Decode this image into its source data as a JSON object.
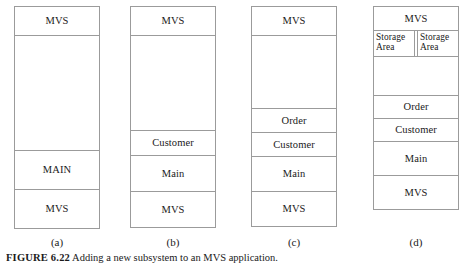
{
  "figure": {
    "caption_label": "FIGURE 6.22",
    "caption_text": "Adding a new subsystem to an MVS application.",
    "panels": [
      {
        "key": "a",
        "subcaption": "(a)",
        "rows": [
          {
            "label": "MVS",
            "height": 30,
            "type": "labeled"
          },
          {
            "label": "",
            "height": 116,
            "type": "empty"
          },
          {
            "label": "MAIN",
            "height": 40,
            "type": "labeled"
          },
          {
            "label": "MVS",
            "height": 40,
            "type": "labeled"
          }
        ]
      },
      {
        "key": "b",
        "subcaption": "(b)",
        "rows": [
          {
            "label": "MVS",
            "height": 30,
            "type": "labeled"
          },
          {
            "label": "",
            "height": 96,
            "type": "empty"
          },
          {
            "label": "Customer",
            "height": 26,
            "type": "labeled"
          },
          {
            "label": "Main",
            "height": 37,
            "type": "labeled"
          },
          {
            "label": "MVS",
            "height": 37,
            "type": "labeled"
          }
        ]
      },
      {
        "key": "c",
        "subcaption": "(c)",
        "rows": [
          {
            "label": "MVS",
            "height": 30,
            "type": "labeled"
          },
          {
            "label": "",
            "height": 74,
            "type": "empty"
          },
          {
            "label": "Order",
            "height": 25,
            "type": "labeled"
          },
          {
            "label": "Customer",
            "height": 25,
            "type": "labeled"
          },
          {
            "label": "Main",
            "height": 36,
            "type": "labeled"
          },
          {
            "label": "MVS",
            "height": 36,
            "type": "labeled"
          }
        ]
      },
      {
        "key": "d",
        "subcaption": "(d)",
        "rows": [
          {
            "label": "MVS",
            "height": 25,
            "type": "labeled"
          },
          {
            "type": "split",
            "height": 27,
            "cells": [
              {
                "line1": "Storage",
                "line2": "Area"
              },
              {
                "line1": "Storage",
                "line2": "Area"
              }
            ]
          },
          {
            "label": "",
            "height": 40,
            "type": "empty"
          },
          {
            "label": "Order",
            "height": 24,
            "type": "labeled"
          },
          {
            "label": "Customer",
            "height": 24,
            "type": "labeled"
          },
          {
            "label": "Main",
            "height": 35,
            "type": "labeled"
          },
          {
            "label": "MVS",
            "height": 35,
            "type": "labeled"
          }
        ]
      }
    ]
  },
  "colors": {
    "border": "#9b9b9b",
    "background": "#ffffff",
    "text": "#1a1a1a"
  }
}
